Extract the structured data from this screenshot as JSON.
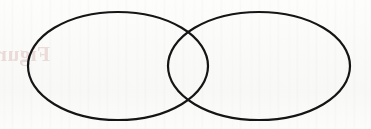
{
  "figure": {
    "kind": "venn-diagram",
    "set_count": 2,
    "canvas": {
      "width": 371,
      "height": 129
    },
    "background_color": "#fbfbfa",
    "stroke_color": "#151515",
    "stroke_width": 2.2,
    "ghost_text": "Figure",
    "ghost_text_color": "#b06060",
    "sets": [
      {
        "name": "left-set",
        "label": "",
        "cx": 118,
        "cy": 66,
        "rx": 90,
        "ry": 54
      },
      {
        "name": "right-set",
        "label": "",
        "cx": 259,
        "cy": 66,
        "rx": 91,
        "ry": 54
      }
    ],
    "regions": [
      {
        "name": "left-only",
        "label": ""
      },
      {
        "name": "intersection",
        "label": ""
      },
      {
        "name": "right-only",
        "label": ""
      }
    ],
    "intersection_points": [
      {
        "x": 188,
        "y": 20
      },
      {
        "x": 188,
        "y": 113
      }
    ]
  }
}
